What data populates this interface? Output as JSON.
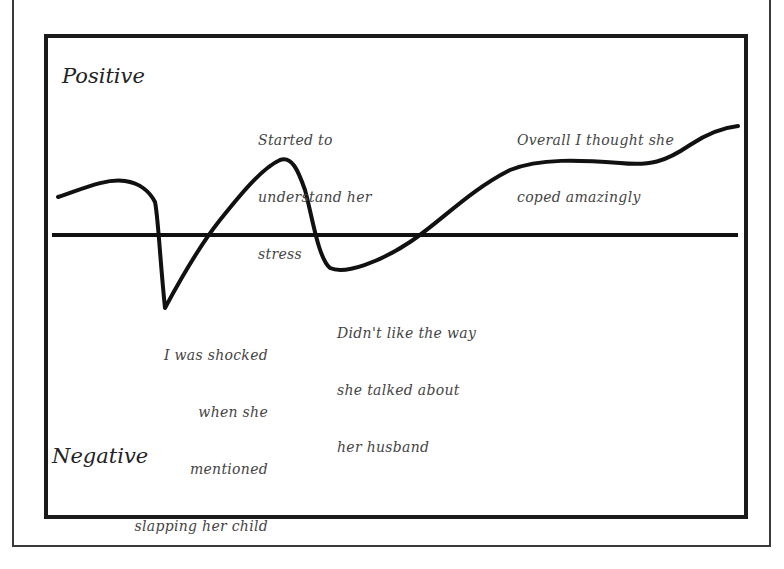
{
  "diagram": {
    "axis_labels": {
      "positive": "Positive",
      "negative": "Negative"
    },
    "annotations": [
      {
        "id": "started-to-understand",
        "lines": [
          "Started to",
          "understand her",
          "stress"
        ]
      },
      {
        "id": "overall-coped",
        "lines": [
          "Overall I thought she",
          "coped amazingly"
        ]
      },
      {
        "id": "shocked",
        "lines": [
          "I was shocked",
          "when she",
          "mentioned",
          "slapping her child"
        ]
      },
      {
        "id": "didnt-like",
        "lines": [
          "Didn't like the way",
          "she talked about",
          "her husband"
        ]
      }
    ],
    "colors": {
      "line": "#111111",
      "frame": "#1a1a1a",
      "text": "#333333"
    }
  }
}
